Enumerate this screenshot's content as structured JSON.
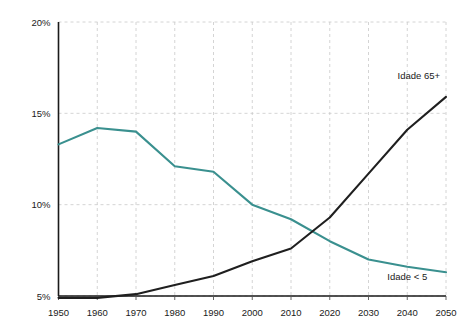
{
  "chart_data": {
    "type": "line",
    "title": "",
    "subtitle": "",
    "xlabel": "",
    "ylabel": "",
    "x": [
      1950,
      1960,
      1970,
      1980,
      1990,
      2000,
      2010,
      2020,
      2030,
      2040,
      2050
    ],
    "categories": [
      "1950",
      "1960",
      "1970",
      "1980",
      "1990",
      "2000",
      "2010",
      "2020",
      "2030",
      "2040",
      "2050"
    ],
    "xlim": [
      1950,
      2050
    ],
    "ylim": [
      5,
      20
    ],
    "yticks": [
      5,
      10,
      15,
      20
    ],
    "ytick_labels": [
      "5%",
      "10%",
      "15%",
      "20%"
    ],
    "xticks": [
      1950,
      1960,
      1970,
      1980,
      1990,
      2000,
      2010,
      2020,
      2030,
      2040,
      2050
    ],
    "xtick_labels": [
      "1950",
      "1960",
      "1970",
      "1980",
      "1990",
      "2000",
      "2010",
      "2020",
      "2030",
      "2040",
      "2050"
    ],
    "grid": true,
    "grid_style": "dashed",
    "legend_position": "inline-annotations",
    "series": [
      {
        "name": "Idade < 5",
        "label": "Idade < 5",
        "color": "#3a908f",
        "values": [
          13.3,
          14.2,
          14.0,
          12.1,
          11.8,
          10.0,
          9.2,
          8.0,
          7.0,
          6.6,
          6.3
        ]
      },
      {
        "name": "Idade 65+",
        "label": "Idade 65+",
        "color": "#1f1f1f",
        "values": [
          4.9,
          4.9,
          5.1,
          5.6,
          6.1,
          6.9,
          7.6,
          9.3,
          11.7,
          14.1,
          15.9
        ]
      }
    ],
    "annotations": [
      {
        "text": "Idade 65+",
        "series": "Idade 65+",
        "x": 2043,
        "y": 16.9
      },
      {
        "text": "Idade < 5",
        "series": "Idade < 5",
        "x": 2040,
        "y": 5.85
      }
    ]
  },
  "axes": {
    "y_axis_name": "percent-axis",
    "x_axis_name": "year-axis"
  },
  "colors": {
    "series_under5": "#3a908f",
    "series_65plus": "#1f1f1f",
    "grid": "#c9c9c9",
    "axis": "#1a1a1a",
    "background": "#ffffff"
  }
}
